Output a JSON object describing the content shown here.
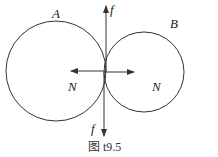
{
  "diagram": {
    "caption": "图 t9.5",
    "wheel_a": {
      "label": "A",
      "normal_label": "N",
      "friction_label": "f",
      "friction_direction": "up",
      "normal_direction": "left"
    },
    "wheel_b": {
      "label": "B",
      "normal_label": "N",
      "friction_label": "f",
      "friction_direction": "down",
      "normal_direction": "right"
    }
  },
  "colors": {
    "stroke": "#333333",
    "background": "#ffffff"
  }
}
